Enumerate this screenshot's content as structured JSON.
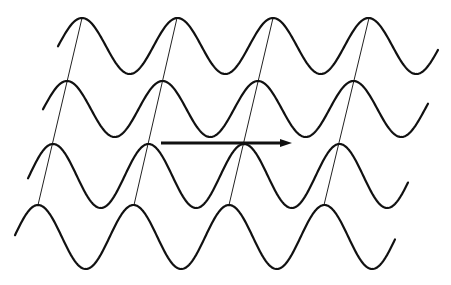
{
  "diagram": {
    "title": "",
    "colors": {
      "background": "#ffffff",
      "wave": "#111111",
      "phase_line": "#222222",
      "arrow": "#111111"
    },
    "waves": [
      {
        "id": "wave-1",
        "center_y": 46,
        "amplitude": 28,
        "period": 95.5,
        "first_peak_x": 82,
        "x_start": 58,
        "x_end": 438
      },
      {
        "id": "wave-2",
        "center_y": 109,
        "amplitude": 28,
        "period": 95.5,
        "first_peak_x": 67,
        "x_start": 43,
        "x_end": 428
      },
      {
        "id": "wave-3",
        "center_y": 176,
        "amplitude": 32,
        "period": 95.5,
        "first_peak_x": 53,
        "x_start": 28,
        "x_end": 408
      },
      {
        "id": "wave-4",
        "center_y": 237,
        "amplitude": 32,
        "period": 95.5,
        "first_peak_x": 38,
        "x_start": 15,
        "x_end": 395
      }
    ],
    "phase_lines": [
      {
        "x1": 82,
        "y1": 18,
        "x2": 38,
        "y2": 205
      },
      {
        "x1": 177,
        "y1": 18,
        "x2": 134,
        "y2": 205
      },
      {
        "x1": 273,
        "y1": 18,
        "x2": 229,
        "y2": 205
      },
      {
        "x1": 369,
        "y1": 18,
        "x2": 324,
        "y2": 205
      }
    ],
    "arrow": {
      "x1": 161,
      "y1": 143,
      "x2": 292,
      "y2": 143,
      "direction": "right"
    }
  }
}
